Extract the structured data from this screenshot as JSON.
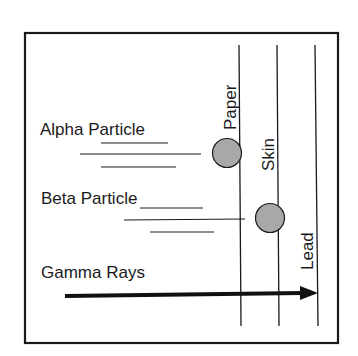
{
  "diagram": {
    "colors": {
      "line": "#1a1a1a",
      "particle_fill": "#a8a8a8",
      "background": "#ffffff"
    },
    "barriers": [
      {
        "label": "Paper"
      },
      {
        "label": "Skin"
      },
      {
        "label": "Lead"
      }
    ],
    "radiation": [
      {
        "label": "Alpha Particle",
        "stopped_by": "Paper"
      },
      {
        "label": "Beta Particle",
        "stopped_by": "Skin"
      },
      {
        "label": "Gamma Rays",
        "stopped_by": "Lead"
      }
    ]
  }
}
